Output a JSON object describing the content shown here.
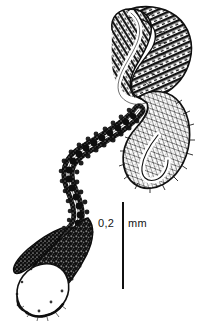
{
  "figure": {
    "kind": "scientific-line-drawing",
    "technique": "pen-and-ink hatching and stipple",
    "background_color": "#ffffff",
    "ink_color": "#101010"
  },
  "scalebar": {
    "value": "0,2",
    "unit": "mm",
    "orientation": "vertical",
    "length_px": 87,
    "x_px": 122,
    "y_top_px": 202,
    "y_bottom_px": 289,
    "color": "#101010"
  },
  "structures": [
    {
      "name": "upper-lobe",
      "description": "large hook-shaped striated lobe at top right with dense transverse hatching and a pale sinuous central lumen"
    },
    {
      "name": "lower-sac",
      "description": "rounded sac below the upper lobe with radiating hatching and a curved inner white lumen"
    },
    {
      "name": "connecting-duct",
      "description": "wavy beaded dark duct running diagonally from the sac down to the terminal bulb, with a thin white lumen line"
    },
    {
      "name": "terminal-bulb",
      "description": "dark stippled leaf-shaped terminal bulb at lower left enclosing a pale circular chamber"
    }
  ]
}
